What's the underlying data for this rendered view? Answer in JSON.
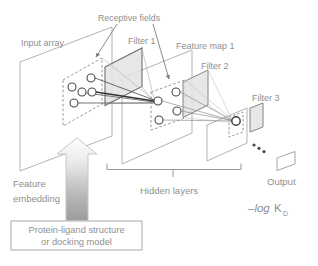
{
  "figure": {
    "labels": {
      "receptive_fields": "Receptive fields",
      "input_array": "Input array",
      "filter_1": "Filter 1",
      "feature_map_1": "Feature map 1",
      "filter_2": "Filter 2",
      "filter_3": "Filter 3",
      "feature_embedding_line1": "Feature",
      "feature_embedding_line2": "embedding",
      "hidden_layers": "Hidden layers",
      "output": "Output"
    },
    "formula": {
      "prefix": "–log",
      "symbol": "K",
      "subscript": "D"
    },
    "annotation_box": {
      "line1": "Protein-ligand structure",
      "line2": "or docking model"
    },
    "colors": {
      "label_text": "#8f8f8f",
      "plane_stroke": "#b3b3b3",
      "filter_fill": "#e3e3e3",
      "filter_stroke": "#848484",
      "node_stroke": "#4a4a4a",
      "dashed_field_stroke": "#8a8a8a",
      "connection_dark": "#3f3f3f",
      "connection_light": "#b8b8b8",
      "arrow_top": "#ffffff",
      "arrow_bottom": "#9c9c9c",
      "box_border": "#b8b8b8"
    }
  }
}
